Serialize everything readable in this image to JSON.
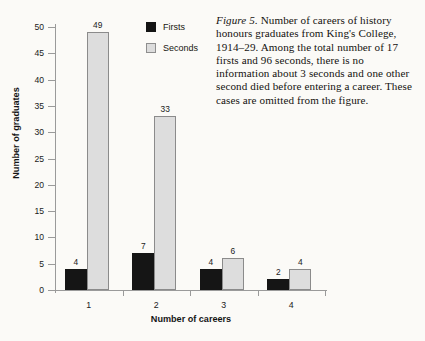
{
  "caption": {
    "figure_label": "Figure 5.",
    "text": "  Number of careers of history honours graduates from King's College, 1914–29. Among the total number of 17 firsts and 96 seconds, there is no information about 3 seconds and one other second died before entering a career. These cases are omitted from the figure."
  },
  "legend": {
    "items": [
      {
        "label": "Firsts",
        "color": "#151515"
      },
      {
        "label": "Seconds",
        "color": "#dddddd"
      }
    ]
  },
  "chart_data": {
    "type": "bar",
    "title": "",
    "xlabel": "Number of careers",
    "ylabel": "Number of graduates",
    "categories": [
      "1",
      "2",
      "3",
      "4"
    ],
    "series": [
      {
        "name": "Firsts",
        "values": [
          4,
          7,
          4,
          2
        ],
        "color": "#151515"
      },
      {
        "name": "Seconds",
        "values": [
          49,
          33,
          6,
          4
        ],
        "color": "#dddddd"
      }
    ],
    "ylim": [
      0,
      50
    ],
    "yticks": [
      0,
      5,
      10,
      15,
      20,
      25,
      30,
      35,
      40,
      45,
      50
    ],
    "ytick_labels": [
      "0",
      "5",
      "10",
      "15",
      "20",
      "25",
      "30",
      "35",
      "40",
      "45",
      "50"
    ],
    "grid": false,
    "legend_position": "top-center",
    "data_labels": [
      {
        "group": "1",
        "series": "Firsts",
        "value": "4"
      },
      {
        "group": "1",
        "series": "Seconds",
        "value": "49"
      },
      {
        "group": "2",
        "series": "Firsts",
        "value": "7"
      },
      {
        "group": "2",
        "series": "Seconds",
        "value": "33"
      },
      {
        "group": "3",
        "series": "Firsts",
        "value": "4"
      },
      {
        "group": "3",
        "series": "Seconds",
        "value": "6"
      },
      {
        "group": "4",
        "series": "Firsts",
        "value": "2"
      },
      {
        "group": "4",
        "series": "Seconds",
        "value": "4"
      }
    ]
  }
}
